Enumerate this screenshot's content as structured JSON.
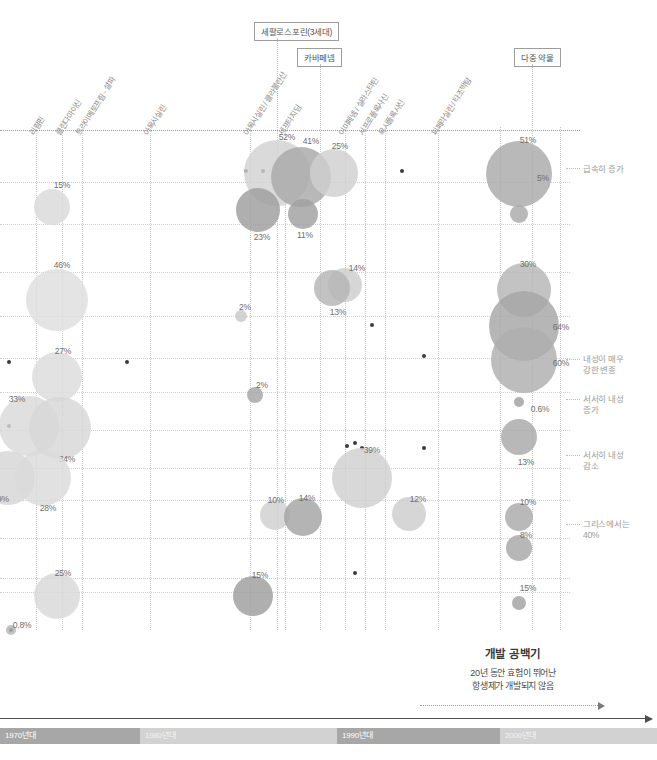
{
  "chart_data": {
    "type": "scatter",
    "title": "",
    "xlabel": "",
    "ylabel": "",
    "x_axis": {
      "type": "decade-bands",
      "bands": [
        {
          "label": "1970년대",
          "shade": "dark",
          "left": 0,
          "width": 140
        },
        {
          "label": "1980년대",
          "shade": "light",
          "left": 140,
          "width": 197
        },
        {
          "label": "1990년대",
          "shade": "dark",
          "left": 337,
          "width": 163
        },
        {
          "label": "2000년대",
          "shade": "light",
          "left": 500,
          "width": 157
        }
      ]
    },
    "drug_labels": [
      {
        "text": "리팜핀",
        "x": 36
      },
      {
        "text": "클린다마이신",
        "x": 62
      },
      {
        "text": "트라이메토프림 - 설파",
        "x": 82
      },
      {
        "text": "아목시실린",
        "x": 150
      },
      {
        "text": "아목시실린 / 클라불란산",
        "x": 250
      },
      {
        "text": "세프타지딤",
        "x": 285
      },
      {
        "text": "이미페넴 / 실라스타틴",
        "x": 345
      },
      {
        "text": "시프로플록사신",
        "x": 365
      },
      {
        "text": "목시플록사신",
        "x": 385
      },
      {
        "text": "피페라실린 / 타조박탐",
        "x": 438
      }
    ],
    "group_boxes": [
      {
        "text": "세팔로스포린(3세대)",
        "left": 254,
        "top": 22,
        "line_x": 277,
        "line_top": 38,
        "line_height": 98
      },
      {
        "text": "카바페넴",
        "left": 297,
        "top": 48,
        "line_x": 320,
        "line_top": 64,
        "line_height": 72
      },
      {
        "text": "다중 약물",
        "left": 514,
        "top": 48,
        "line_x": 532,
        "line_top": 64,
        "line_height": 72
      }
    ],
    "annotations": [
      {
        "text": "급속히 증가",
        "left": 583,
        "top": 164,
        "lead_x": 566,
        "lead_w": 14,
        "lead_y": 168
      },
      {
        "text": "내성이 매우\n강한 변종",
        "left": 583,
        "top": 354,
        "lead_x": 566,
        "lead_w": 14,
        "lead_y": 359
      },
      {
        "text": "서서히 내성\n증가",
        "left": 583,
        "top": 394,
        "lead_x": 566,
        "lead_w": 14,
        "lead_y": 399
      },
      {
        "text": "서서히 내성\n감소",
        "left": 583,
        "top": 450,
        "lead_x": 566,
        "lead_w": 14,
        "lead_y": 455
      },
      {
        "text": "그리스에서는\n40%",
        "left": 583,
        "top": 519,
        "lead_x": 566,
        "lead_w": 14,
        "lead_y": 524
      }
    ],
    "gap_note": {
      "title": "개발 공백기",
      "subtitle": "20년 동안 효험이 뛰어난\n항생제가 개발되지 않음"
    },
    "vgrid_x": [
      36,
      62,
      82,
      150,
      250,
      277,
      285,
      320,
      345,
      365,
      385,
      438,
      500,
      532,
      560
    ],
    "hgrid_y": [
      52,
      94,
      142,
      186,
      228,
      262,
      300,
      338,
      370,
      408,
      448,
      462
    ],
    "dots": [
      {
        "x": 246,
        "y": 41
      },
      {
        "x": 263,
        "y": 41
      },
      {
        "x": 402,
        "y": 41
      },
      {
        "x": 9,
        "y": 232
      },
      {
        "x": 127,
        "y": 232
      },
      {
        "x": 372,
        "y": 195
      },
      {
        "x": 424,
        "y": 226
      },
      {
        "x": 9,
        "y": 296
      },
      {
        "x": 424,
        "y": 318
      },
      {
        "x": 362,
        "y": 318
      },
      {
        "x": 347,
        "y": 316
      },
      {
        "x": 355,
        "y": 443
      },
      {
        "x": 355,
        "y": 313
      },
      {
        "x": 11,
        "y": 500
      }
    ],
    "bubbles": [
      {
        "label": "15%",
        "cx": 52,
        "cy": 77,
        "r": 18,
        "color": "#d9d9d9",
        "lx": 62,
        "ly": 50
      },
      {
        "label": "52%",
        "cx": 277,
        "cy": 43,
        "r": 33,
        "color": "#d2d2d2",
        "lx": 287,
        "ly": 2
      },
      {
        "label": "41%",
        "cx": 301,
        "cy": 47,
        "r": 30,
        "color": "#a8a8a8",
        "lx": 311,
        "ly": 6
      },
      {
        "label": "25%",
        "cx": 334,
        "cy": 43,
        "r": 24,
        "color": "#cfcfcf",
        "lx": 340,
        "ly": 11
      },
      {
        "label": "23%",
        "cx": 258,
        "cy": 80,
        "r": 22,
        "color": "#9d9d9d",
        "lx": 262,
        "ly": 102
      },
      {
        "label": "11%",
        "cx": 303,
        "cy": 84,
        "r": 15,
        "color": "#a0a0a0",
        "lx": 305,
        "ly": 100
      },
      {
        "label": "51%",
        "cx": 519,
        "cy": 44,
        "r": 33,
        "color": "#a9a9a9",
        "lx": 528,
        "ly": 5
      },
      {
        "label": "5%",
        "cx": 519,
        "cy": 84,
        "r": 9,
        "color": "#a9a9a9",
        "lx": 543,
        "ly": 43
      },
      {
        "label": "46%",
        "cx": 57,
        "cy": 170,
        "r": 31,
        "color": "#dedede",
        "lx": 62,
        "ly": 130
      },
      {
        "label": "14%",
        "cx": 345,
        "cy": 155,
        "r": 17,
        "color": "#cdcdcd",
        "lx": 357,
        "ly": 133
      },
      {
        "label": "13%",
        "cx": 332,
        "cy": 158,
        "r": 18,
        "color": "#b4b4b4",
        "lx": 338,
        "ly": 177
      },
      {
        "label": "30%",
        "cx": 524,
        "cy": 160,
        "r": 27,
        "color": "#b6b6b6",
        "lx": 528,
        "ly": 129
      },
      {
        "label": "64%",
        "cx": 524,
        "cy": 196,
        "r": 35,
        "color": "#a6a6a6",
        "lx": 561,
        "ly": 192
      },
      {
        "label": "60%",
        "cx": 524,
        "cy": 230,
        "r": 33,
        "color": "#afafaf",
        "lx": 561,
        "ly": 228
      },
      {
        "label": "2%",
        "cx": 241,
        "cy": 186,
        "r": 6,
        "color": "#c8c8c8",
        "lx": 245,
        "ly": 172
      },
      {
        "label": "2%",
        "cx": 255,
        "cy": 265,
        "r": 8,
        "color": "#a5a5a5",
        "lx": 262,
        "ly": 250
      },
      {
        "label": "27%",
        "cx": 57,
        "cy": 247,
        "r": 25,
        "color": "#dcdcdc",
        "lx": 63,
        "ly": 216
      },
      {
        "label": "33%",
        "cx": 29,
        "cy": 296,
        "r": 30,
        "color": "#d9d9d9",
        "lx": 17,
        "ly": 264
      },
      {
        "label": "34%",
        "cx": 60,
        "cy": 298,
        "r": 31,
        "color": "#d7d7d7",
        "lx": 67,
        "ly": 324
      },
      {
        "label": "9%",
        "cx": 8,
        "cy": 348,
        "r": 27,
        "color": "#d5d5d5",
        "lx": 3,
        "ly": 364
      },
      {
        "label": "28%",
        "cx": 43,
        "cy": 348,
        "r": 28,
        "color": "#dbdbdb",
        "lx": 48,
        "ly": 373
      },
      {
        "label": "0.6%",
        "cx": 519,
        "cy": 272,
        "r": 5,
        "color": "#a0a0a0",
        "lx": 540,
        "ly": 274
      },
      {
        "label": "13%",
        "cx": 519,
        "cy": 307,
        "r": 18,
        "color": "#a8a8a8",
        "lx": 526,
        "ly": 327
      },
      {
        "label": "39%",
        "cx": 362,
        "cy": 348,
        "r": 30,
        "color": "#d0d0d0",
        "lx": 372,
        "ly": 315
      },
      {
        "label": "10%",
        "cx": 275,
        "cy": 385,
        "r": 15,
        "color": "#d0d0d0",
        "lx": 276,
        "ly": 365
      },
      {
        "label": "14%",
        "cx": 303,
        "cy": 387,
        "r": 19,
        "color": "#a4a4a4",
        "lx": 307,
        "ly": 363
      },
      {
        "label": "12%",
        "cx": 409,
        "cy": 384,
        "r": 17,
        "color": "#cdcdcd",
        "lx": 418,
        "ly": 364
      },
      {
        "label": "10%",
        "cx": 519,
        "cy": 387,
        "r": 14,
        "color": "#a9a9a9",
        "lx": 528,
        "ly": 367
      },
      {
        "label": "8%",
        "cx": 519,
        "cy": 418,
        "r": 13,
        "color": "#a7a7a7",
        "lx": 526,
        "ly": 400
      },
      {
        "label": "25%",
        "cx": 57,
        "cy": 466,
        "r": 23,
        "color": "#d8d8d8",
        "lx": 63,
        "ly": 438
      },
      {
        "label": "15%",
        "cx": 253,
        "cy": 466,
        "r": 20,
        "color": "#9e9e9e",
        "lx": 260,
        "ly": 440
      },
      {
        "label": "15%",
        "cx": 519,
        "cy": 473,
        "r": 7,
        "color": "#a2a2a2",
        "lx": 528,
        "ly": 453
      },
      {
        "label": "0.8%",
        "cx": 11,
        "cy": 500,
        "r": 5,
        "color": "#b5b5b5",
        "lx": 22,
        "ly": 490
      }
    ]
  }
}
